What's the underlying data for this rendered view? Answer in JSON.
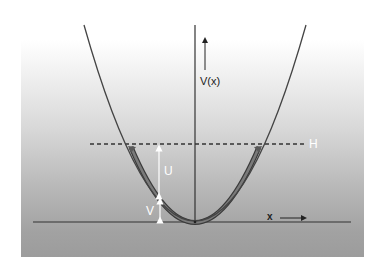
{
  "figure": {
    "labels": {
      "y_axis": "V(x)",
      "x_axis": "x",
      "total_energy": "H",
      "kinetic": "U",
      "potential": "V"
    },
    "colors": {
      "background_top": "#ffffff",
      "background_bottom": "#9c9c9c",
      "curve": "#444444",
      "motion_path": "#6e6e6e",
      "annotation": "#ffffff",
      "axis": "#333333"
    },
    "curve": {
      "shape": "parabola",
      "vertex": [
        195,
        221
      ],
      "left_top": [
        84,
        25
      ],
      "right_top": [
        306,
        25
      ]
    },
    "energy_level_H_y": 144
  }
}
